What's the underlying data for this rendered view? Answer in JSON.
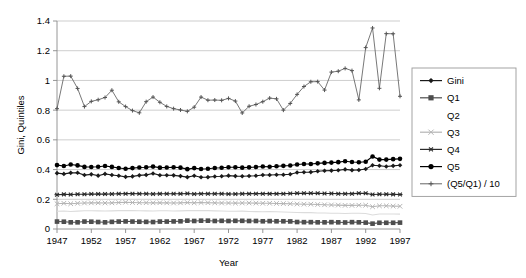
{
  "chart_data": {
    "type": "line",
    "title": "",
    "xlabel": "Year",
    "ylabel": "Gini, Quintiles",
    "xlim": [
      1947,
      1997
    ],
    "ylim": [
      0,
      1.4
    ],
    "ytick_step": 0.2,
    "xtick_step": 5,
    "grid": true,
    "legend_position": "right",
    "yticks": [
      "0",
      "0.2",
      "0.4",
      "0.6",
      "0.8",
      "1",
      "1.2",
      "1.4"
    ],
    "xticks": [
      "1947",
      "1952",
      "1957",
      "1962",
      "1967",
      "1972",
      "1977",
      "1982",
      "1987",
      "1992",
      "1997"
    ],
    "x": [
      1947,
      1948,
      1949,
      1950,
      1951,
      1952,
      1953,
      1954,
      1955,
      1956,
      1957,
      1958,
      1959,
      1960,
      1961,
      1962,
      1963,
      1964,
      1965,
      1966,
      1967,
      1968,
      1969,
      1970,
      1971,
      1972,
      1973,
      1974,
      1975,
      1976,
      1977,
      1978,
      1979,
      1980,
      1981,
      1982,
      1983,
      1984,
      1985,
      1986,
      1987,
      1988,
      1989,
      1990,
      1991,
      1992,
      1993,
      1994,
      1995,
      1996,
      1997
    ],
    "series": [
      {
        "name": "Gini",
        "marker": "diamond",
        "color": "#1a1a1a",
        "values": [
          0.376,
          0.371,
          0.378,
          0.379,
          0.363,
          0.368,
          0.359,
          0.371,
          0.363,
          0.358,
          0.351,
          0.354,
          0.361,
          0.364,
          0.374,
          0.362,
          0.362,
          0.361,
          0.356,
          0.349,
          0.358,
          0.348,
          0.349,
          0.353,
          0.355,
          0.359,
          0.356,
          0.355,
          0.357,
          0.358,
          0.363,
          0.363,
          0.365,
          0.365,
          0.369,
          0.38,
          0.382,
          0.383,
          0.389,
          0.392,
          0.393,
          0.395,
          0.401,
          0.396,
          0.397,
          0.404,
          0.429,
          0.426,
          0.421,
          0.425,
          0.429
        ]
      },
      {
        "name": "Q1",
        "marker": "square",
        "color": "#4d4d4d",
        "values": [
          0.05,
          0.049,
          0.045,
          0.045,
          0.05,
          0.049,
          0.047,
          0.045,
          0.048,
          0.05,
          0.051,
          0.05,
          0.049,
          0.048,
          0.047,
          0.05,
          0.05,
          0.051,
          0.052,
          0.056,
          0.054,
          0.056,
          0.056,
          0.054,
          0.055,
          0.054,
          0.055,
          0.055,
          0.054,
          0.054,
          0.052,
          0.053,
          0.052,
          0.052,
          0.051,
          0.047,
          0.046,
          0.046,
          0.045,
          0.045,
          0.046,
          0.045,
          0.044,
          0.046,
          0.045,
          0.043,
          0.036,
          0.042,
          0.042,
          0.042,
          0.043
        ]
      },
      {
        "name": "Q2",
        "marker": "none",
        "color": "#dcdcdc",
        "values": [
          0.119,
          0.121,
          0.118,
          0.12,
          0.123,
          0.123,
          0.122,
          0.121,
          0.122,
          0.124,
          0.125,
          0.124,
          0.123,
          0.122,
          0.121,
          0.123,
          0.123,
          0.121,
          0.122,
          0.124,
          0.124,
          0.124,
          0.124,
          0.122,
          0.121,
          0.119,
          0.119,
          0.12,
          0.118,
          0.117,
          0.116,
          0.117,
          0.116,
          0.114,
          0.113,
          0.111,
          0.11,
          0.11,
          0.108,
          0.108,
          0.106,
          0.106,
          0.104,
          0.106,
          0.106,
          0.104,
          0.094,
          0.101,
          0.101,
          0.101,
          0.1
        ]
      },
      {
        "name": "Q3",
        "marker": "x",
        "color": "#b5b5b5",
        "values": [
          0.17,
          0.173,
          0.17,
          0.173,
          0.175,
          0.176,
          0.176,
          0.175,
          0.176,
          0.178,
          0.18,
          0.178,
          0.177,
          0.177,
          0.176,
          0.177,
          0.176,
          0.175,
          0.176,
          0.178,
          0.176,
          0.178,
          0.177,
          0.176,
          0.175,
          0.175,
          0.174,
          0.175,
          0.175,
          0.174,
          0.173,
          0.173,
          0.172,
          0.171,
          0.17,
          0.168,
          0.167,
          0.167,
          0.165,
          0.163,
          0.162,
          0.161,
          0.159,
          0.159,
          0.16,
          0.16,
          0.15,
          0.156,
          0.156,
          0.154,
          0.153
        ]
      },
      {
        "name": "Q4",
        "marker": "asterisk",
        "color": "#2b2b2b",
        "values": [
          0.231,
          0.233,
          0.232,
          0.234,
          0.234,
          0.235,
          0.236,
          0.235,
          0.236,
          0.237,
          0.238,
          0.238,
          0.237,
          0.237,
          0.236,
          0.237,
          0.237,
          0.237,
          0.237,
          0.239,
          0.236,
          0.238,
          0.237,
          0.237,
          0.237,
          0.236,
          0.236,
          0.237,
          0.238,
          0.238,
          0.238,
          0.238,
          0.238,
          0.238,
          0.239,
          0.24,
          0.24,
          0.24,
          0.24,
          0.239,
          0.239,
          0.238,
          0.237,
          0.238,
          0.24,
          0.24,
          0.232,
          0.234,
          0.234,
          0.233,
          0.232
        ]
      },
      {
        "name": "Q5",
        "marker": "circle",
        "color": "#000000",
        "values": [
          0.43,
          0.424,
          0.434,
          0.428,
          0.418,
          0.417,
          0.419,
          0.424,
          0.418,
          0.411,
          0.406,
          0.41,
          0.414,
          0.416,
          0.42,
          0.413,
          0.414,
          0.416,
          0.413,
          0.403,
          0.41,
          0.404,
          0.406,
          0.411,
          0.412,
          0.416,
          0.416,
          0.413,
          0.415,
          0.417,
          0.421,
          0.419,
          0.422,
          0.425,
          0.427,
          0.434,
          0.437,
          0.437,
          0.442,
          0.445,
          0.447,
          0.45,
          0.456,
          0.451,
          0.449,
          0.453,
          0.488,
          0.467,
          0.467,
          0.47,
          0.472
        ]
      },
      {
        "name": "(Q5/Q1) / 10",
        "marker": "plus",
        "color": "#555555",
        "values": [
          0.81,
          1.028,
          1.029,
          0.946,
          0.824,
          0.859,
          0.87,
          0.885,
          0.934,
          0.856,
          0.824,
          0.797,
          0.782,
          0.857,
          0.888,
          0.853,
          0.825,
          0.81,
          0.801,
          0.792,
          0.82,
          0.888,
          0.867,
          0.868,
          0.866,
          0.879,
          0.861,
          0.781,
          0.826,
          0.838,
          0.857,
          0.881,
          0.876,
          0.8,
          0.845,
          0.906,
          0.959,
          0.991,
          0.992,
          0.935,
          1.056,
          1.062,
          1.081,
          1.066,
          0.869,
          1.221,
          1.353,
          0.947,
          1.315,
          1.314,
          0.893
        ]
      }
    ]
  },
  "legend": {
    "items": [
      {
        "label": "Gini"
      },
      {
        "label": "Q1"
      },
      {
        "label": "Q2"
      },
      {
        "label": "Q3"
      },
      {
        "label": "Q4"
      },
      {
        "label": "Q5"
      },
      {
        "label": "(Q5/Q1) / 10"
      }
    ]
  }
}
